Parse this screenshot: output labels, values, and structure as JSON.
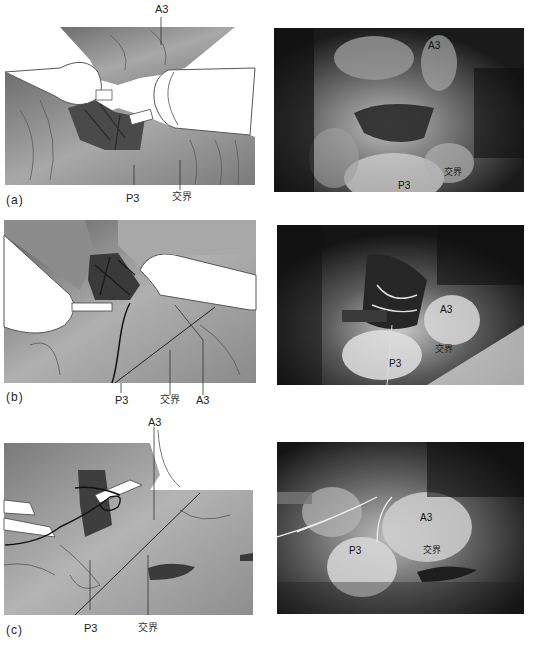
{
  "figure": {
    "panels": [
      {
        "id": "a",
        "letter": "(a)",
        "illustration_labels": {
          "top": "A3",
          "bottom_left": "P3",
          "bottom_right": "交界"
        },
        "photo_labels": {
          "a3": "A3",
          "p3": "P3",
          "junction": "交界"
        }
      },
      {
        "id": "b",
        "letter": "(b)",
        "illustration_labels": {
          "p3": "P3",
          "junction": "交界",
          "a3": "A3"
        },
        "photo_labels": {
          "a3": "A3",
          "p3": "P3",
          "junction": "交界"
        }
      },
      {
        "id": "c",
        "letter": "(c)",
        "illustration_labels": {
          "top": "A3",
          "p3": "P3",
          "junction": "交界"
        },
        "photo_labels": {
          "a3": "A3",
          "p3": "P3",
          "junction": "交界"
        }
      }
    ],
    "caption": ""
  },
  "colors": {
    "illustration_fill": "#9a9a9a",
    "illustration_dark": "#4a4a4a",
    "photo_bg": "#1a1a1a",
    "suture": "#111111",
    "background": "#ffffff"
  }
}
